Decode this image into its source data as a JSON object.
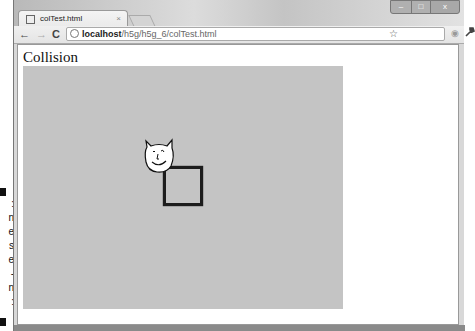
{
  "browser": {
    "tab": {
      "title": "colTest.html",
      "close": "×"
    },
    "window_controls": {
      "minimize": "–",
      "maximize": "□",
      "close": "x"
    },
    "toolbar": {
      "back": "←",
      "forward": "→",
      "reload": "C",
      "url_host": "localhost",
      "url_path": "/h5g/h5g_6/colTest.html",
      "bookmark_star": "☆",
      "extension": "◉",
      "wrench": "🔧"
    }
  },
  "page": {
    "heading": "Collision",
    "canvas": {
      "background": "#c4c4c4",
      "sprite": "critter-face",
      "target_box": "black square outline"
    }
  },
  "margin_caption_fragments": [
    ":",
    "n",
    "e",
    "s",
    "e",
    "-",
    "n",
    ":"
  ]
}
